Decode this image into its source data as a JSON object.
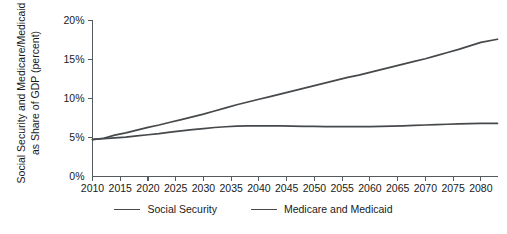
{
  "chart_data": {
    "type": "line",
    "title": "",
    "xlabel": "",
    "ylabel": "Social Security and Medicare/Medicaid as Share of GDP (percent)",
    "ylabel_lines": [
      "Social Security and Medicare/Medicaid",
      "as Share of GDP (percent)"
    ],
    "grid": false,
    "legend_position": "bottom-center",
    "xlim": [
      2010,
      2083
    ],
    "ylim": [
      0,
      20
    ],
    "xticks": [
      2010,
      2015,
      2020,
      2025,
      2030,
      2035,
      2040,
      2045,
      2050,
      2055,
      2060,
      2065,
      2070,
      2075,
      2080
    ],
    "xtick_labels": [
      "2010",
      "2015",
      "2020",
      "2025",
      "2030",
      "2035",
      "2040",
      "2045",
      "2050",
      "2055",
      "2060",
      "2065",
      "2070",
      "2075",
      "2080"
    ],
    "yticks": [
      0,
      5,
      10,
      15,
      20
    ],
    "ytick_labels": [
      "0%",
      "5%",
      "10%",
      "15%",
      "20%"
    ],
    "x": [
      2010,
      2012,
      2014,
      2016,
      2018,
      2020,
      2022,
      2024,
      2026,
      2028,
      2030,
      2032,
      2034,
      2036,
      2038,
      2040,
      2042,
      2044,
      2046,
      2048,
      2050,
      2052,
      2054,
      2056,
      2058,
      2060,
      2062,
      2064,
      2066,
      2068,
      2070,
      2072,
      2074,
      2076,
      2078,
      2080,
      2083
    ],
    "series": [
      {
        "name": "Social Security",
        "color": "#46494c",
        "values": [
          4.75,
          4.85,
          4.95,
          5.05,
          5.2,
          5.35,
          5.5,
          5.7,
          5.85,
          6.0,
          6.15,
          6.28,
          6.38,
          6.45,
          6.48,
          6.5,
          6.5,
          6.48,
          6.45,
          6.43,
          6.42,
          6.4,
          6.4,
          6.4,
          6.4,
          6.4,
          6.42,
          6.45,
          6.5,
          6.55,
          6.6,
          6.65,
          6.7,
          6.75,
          6.78,
          6.8,
          6.82
        ]
      },
      {
        "name": "Medicare and Medicaid",
        "color": "#46494c",
        "values": [
          4.72,
          4.9,
          5.3,
          5.6,
          5.95,
          6.3,
          6.6,
          6.95,
          7.3,
          7.65,
          8.0,
          8.4,
          8.8,
          9.2,
          9.55,
          9.9,
          10.25,
          10.6,
          10.95,
          11.3,
          11.65,
          12.0,
          12.35,
          12.7,
          13.0,
          13.35,
          13.7,
          14.05,
          14.4,
          14.75,
          15.1,
          15.5,
          15.9,
          16.3,
          16.75,
          17.2,
          17.6
        ]
      }
    ]
  },
  "legend": {
    "items": [
      {
        "label": "Social Security"
      },
      {
        "label": "Medicare and Medicaid"
      }
    ]
  }
}
